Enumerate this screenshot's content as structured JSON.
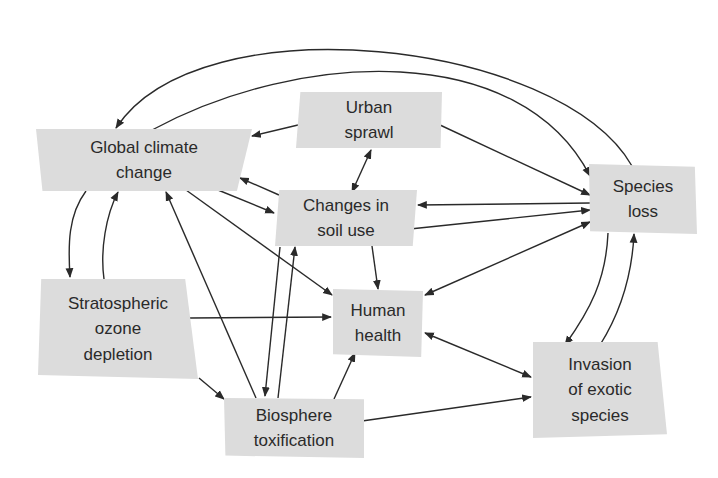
{
  "diagram": {
    "colors": {
      "box_fill": "#dcdcdc",
      "arrow": "#2a2a2a",
      "text": "#2a2a2a",
      "background": "#ffffff"
    },
    "nodes": {
      "global_climate_change": {
        "label": "Global climate\nchange"
      },
      "urban_sprawl": {
        "label": "Urban\nsprawl"
      },
      "changes_in_soil_use": {
        "label": "Changes in\nsoil use"
      },
      "species_loss": {
        "label": "Species\nloss"
      },
      "stratospheric_ozone_depletion": {
        "label": "Stratospheric\nozone\ndepletion"
      },
      "human_health": {
        "label": "Human\nhealth"
      },
      "biosphere_toxification": {
        "label": "Biosphere\ntoxification"
      },
      "invasion_of_exotic_species": {
        "label": "Invasion\nof exotic\nspecies"
      }
    },
    "edges": [
      {
        "from": "species_loss",
        "to": "global_climate_change",
        "type": "directed"
      },
      {
        "from": "global_climate_change",
        "to": "species_loss",
        "type": "directed"
      },
      {
        "from": "urban_sprawl",
        "to": "global_climate_change",
        "type": "directed"
      },
      {
        "from": "urban_sprawl",
        "to": "species_loss",
        "type": "directed"
      },
      {
        "from": "urban_sprawl",
        "to": "changes_in_soil_use",
        "type": "bidirectional"
      },
      {
        "from": "changes_in_soil_use",
        "to": "global_climate_change",
        "type": "directed"
      },
      {
        "from": "global_climate_change",
        "to": "changes_in_soil_use",
        "type": "directed"
      },
      {
        "from": "species_loss",
        "to": "changes_in_soil_use",
        "type": "directed"
      },
      {
        "from": "changes_in_soil_use",
        "to": "species_loss",
        "type": "directed"
      },
      {
        "from": "global_climate_change",
        "to": "stratospheric_ozone_depletion",
        "type": "directed"
      },
      {
        "from": "stratospheric_ozone_depletion",
        "to": "global_climate_change",
        "type": "directed"
      },
      {
        "from": "global_climate_change",
        "to": "human_health",
        "type": "directed"
      },
      {
        "from": "biosphere_toxification",
        "to": "global_climate_change",
        "type": "directed"
      },
      {
        "from": "changes_in_soil_use",
        "to": "human_health",
        "type": "directed"
      },
      {
        "from": "changes_in_soil_use",
        "to": "biosphere_toxification",
        "type": "directed"
      },
      {
        "from": "biosphere_toxification",
        "to": "changes_in_soil_use",
        "type": "directed"
      },
      {
        "from": "species_loss",
        "to": "human_health",
        "type": "bidirectional"
      },
      {
        "from": "stratospheric_ozone_depletion",
        "to": "human_health",
        "type": "directed"
      },
      {
        "from": "stratospheric_ozone_depletion",
        "to": "biosphere_toxification",
        "type": "directed"
      },
      {
        "from": "biosphere_toxification",
        "to": "human_health",
        "type": "directed"
      },
      {
        "from": "human_health",
        "to": "invasion_of_exotic_species",
        "type": "bidirectional"
      },
      {
        "from": "biosphere_toxification",
        "to": "invasion_of_exotic_species",
        "type": "directed"
      },
      {
        "from": "species_loss",
        "to": "invasion_of_exotic_species",
        "type": "directed"
      },
      {
        "from": "invasion_of_exotic_species",
        "to": "species_loss",
        "type": "directed"
      }
    ]
  }
}
